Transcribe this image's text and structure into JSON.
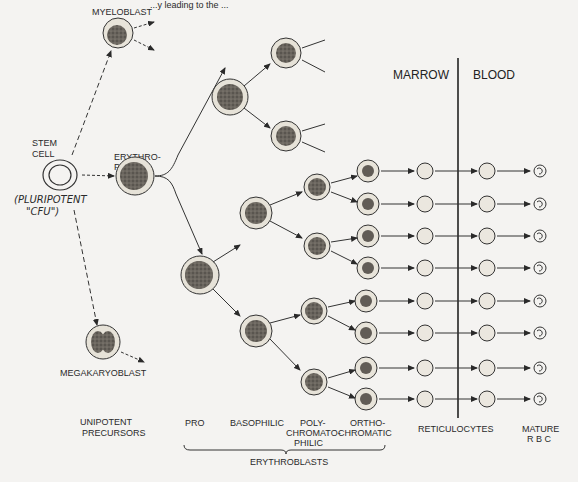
{
  "title_fragment": "...y leading to the ...",
  "labels": {
    "myeloblast": "MYELOBLAST",
    "stem_cell_line1": "STEM",
    "stem_cell_line2": "CELL",
    "pluripotent_line1": "(PLURIPOTENT",
    "pluripotent_line2": "\"CFU\")",
    "erythropoietin_line1": "ERYTHRO-",
    "erythropoietin_line2": "POIETIN",
    "megakaryoblast": "MEGAKARYOBLAST",
    "marrow": "MARROW",
    "blood": "BLOOD"
  },
  "stages": {
    "unipotent_line1": "UNIPOTENT",
    "unipotent_line2": "PRECURSORS",
    "pro": "PRO",
    "basophilic": "BASOPHILIC",
    "poly_line1": "POLY-",
    "poly_line2": "CHROMATO-",
    "poly_line3": "PHILIC",
    "ortho_line1": "ORTHO-",
    "ortho_line2": "CHROMATIC",
    "erythroblasts": "ERYTHROBLASTS",
    "reticulocytes": "RETICULOCYTES",
    "mature_line1": "MATURE",
    "mature_line2": "R B C"
  },
  "colors": {
    "ink": "#2a2a2a",
    "cytoplasm": "#e6e2d8",
    "nucleus": "#6e6a64",
    "paper": "#f4f3f1"
  },
  "rows_y": [
    197,
    232,
    268,
    302,
    337,
    372,
    406,
    437
  ]
}
